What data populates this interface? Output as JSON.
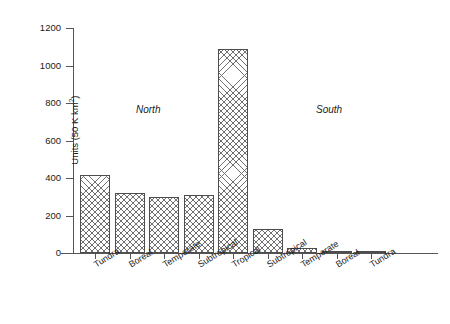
{
  "chart_data": {
    "type": "bar",
    "title": "",
    "xlabel": "",
    "ylabel": "Units (50 K km2)",
    "ylabel_base": "Units (50 K km",
    "ylabel_sup": "2",
    "ylabel_tail": ")",
    "ylim": [
      0,
      1200
    ],
    "grid": false,
    "legend": "none",
    "categories": [
      "Tundra",
      "Boreal",
      "Temperate",
      "Subtropical",
      "Tropical",
      "Subtropical",
      "Temperate",
      "Boreal",
      "Tundra"
    ],
    "values": [
      415,
      318,
      300,
      312,
      1090,
      130,
      25,
      10,
      8
    ],
    "ytick_labels": [
      "0",
      "200",
      "400",
      "600",
      "800",
      "1000",
      "1200"
    ],
    "ytick_values": [
      0,
      200,
      400,
      600,
      800,
      1000,
      1200
    ],
    "annotations": [
      {
        "text": "North",
        "style": "italic"
      },
      {
        "text": "South",
        "style": "italic"
      }
    ],
    "bar_fill": "cross-hatch",
    "bar_edge_color": "#4d4d4d",
    "axis_color": "#555555"
  },
  "figure": {
    "caption": ""
  }
}
